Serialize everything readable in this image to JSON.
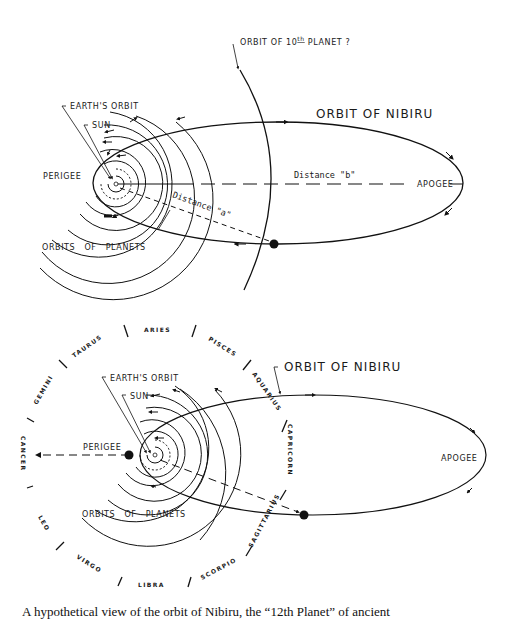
{
  "top_diagram": {
    "labels": {
      "tenth_planet": "ORBIT OF 10",
      "tenth_planet_sup": "th",
      "tenth_planet_tail": " PLANET ?",
      "earths_orbit": "EARTH'S ORBIT",
      "sun": "SUN",
      "orbit_of_nibiru": "ORBIT OF NIBIRU",
      "perigee": "PERIGEE",
      "apogee": "APOGEE",
      "distance_b": "Distance \"b\"",
      "distance_a": "Distance \"a\"",
      "orbits_of_planets": "ORBITS OF PLANETS"
    }
  },
  "bottom_diagram": {
    "labels": {
      "earths_orbit": "EARTH'S ORBIT",
      "sun": "SUN",
      "orbit_of_nibiru": "ORBIT OF NIBIRU",
      "perigee": "PERIGEE",
      "apogee": "APOGEE",
      "orbits_of_planets": "ORBITS OF PLANETS"
    },
    "zodiac": [
      {
        "name": "ARIES"
      },
      {
        "name": "PISCES"
      },
      {
        "name": "AQUARIUS"
      },
      {
        "name": "CAPRICORN"
      },
      {
        "name": "SAGITTARIUS"
      },
      {
        "name": "SCORPIO"
      },
      {
        "name": "LIBRA"
      },
      {
        "name": "VIRGO"
      },
      {
        "name": "LEO"
      },
      {
        "name": "CANCER"
      },
      {
        "name": "GEMINI"
      },
      {
        "name": "TAURUS"
      }
    ]
  },
  "caption": "A hypothetical view of the orbit of Nibiru, the “12th Planet” of ancient"
}
